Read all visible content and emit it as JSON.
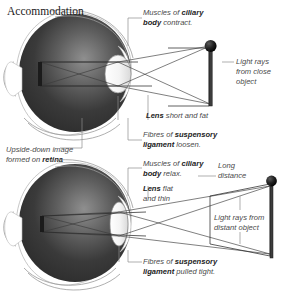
{
  "page": {
    "title": "Accommodation",
    "width": 285,
    "height": 291,
    "background": "#ffffff"
  },
  "colors": {
    "text_label": "#4a4a4a",
    "text_bold": "#1c1c1c",
    "title": "#1a1a1a",
    "leader_line": "#8d8d8d",
    "ray_line": "#3a3a3a",
    "eye_dark": "#2e2e2e",
    "eye_light": "#e8e8e8",
    "object": "#1b1b1b"
  },
  "diagrams": [
    {
      "id": "near-vision",
      "name": "close-object-accommodation",
      "labels": {
        "ciliary": {
          "line1_pre": "Muscles of ",
          "line1_bold": "ciliary",
          "line2_bold": "body",
          "line2_post": " contract."
        },
        "lens": {
          "bold": "Lens",
          "rest": " short and fat"
        },
        "suspensory": {
          "line1_pre": "Fibres of ",
          "line1_bold": "suspensory",
          "line2_bold": "ligament",
          "line2_post": " loosen."
        },
        "light_rays": {
          "line1": "Light rays",
          "line2": "from close",
          "line3": "object"
        },
        "retina": {
          "line1": "Upside-down image",
          "line2_pre": "formed on ",
          "line2_bold": "retina"
        }
      }
    },
    {
      "id": "far-vision",
      "name": "distant-object-accommodation",
      "labels": {
        "ciliary": {
          "line1_pre": "Muscles of ",
          "line1_bold": "ciliary",
          "line2_bold": "body",
          "line2_post": " relax."
        },
        "lens": {
          "bold": "Lens",
          "rest": " flat",
          "line2": "and thin"
        },
        "suspensory": {
          "line1_pre": "Fibres of ",
          "line1_bold": "suspensory",
          "line2_bold": "ligament",
          "line2_post": " pulled tight."
        },
        "distance": {
          "line1": "Long",
          "line2": "distance"
        },
        "light_rays": {
          "line1": "Light rays from",
          "line2": "distant object"
        }
      }
    }
  ],
  "icons": {
    "object_pin": "object-pin-icon",
    "eyeball": "eyeball-icon",
    "lens": "lens-icon"
  }
}
